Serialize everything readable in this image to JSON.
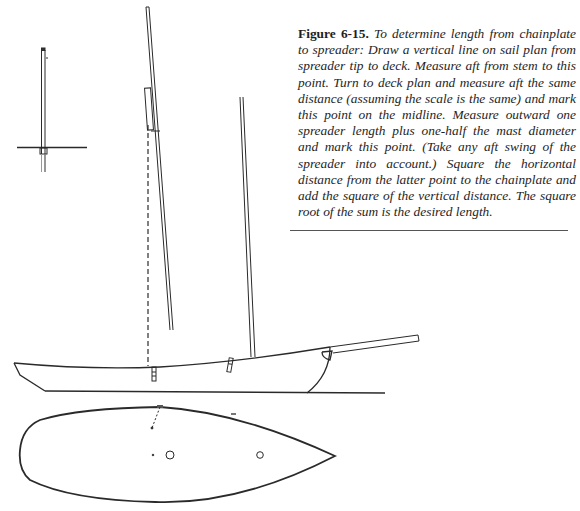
{
  "figure": {
    "label": "Figure 6-15.",
    "caption": "To determine length from chainplate to spreader: Draw a vertical line on sail plan from spreader tip to deck. Measure aft from stem to this point. Turn to deck plan and measure aft the same distance (assuming the scale is the same) and mark this point on the midline. Measure outward one spreader length plus one-half the mast diameter and mark this point. (Take any aft swing of the spreader into account.) Square the horizontal distance from the latter point to the chainplate and add the square of the vertical distance. The square root of the sum is the desired length.",
    "views": [
      "mast-section-with-spreader",
      "sail-plan-profile",
      "deck-plan"
    ],
    "colors": {
      "ink": "#1e1e1e",
      "paper": "#ffffff"
    }
  }
}
